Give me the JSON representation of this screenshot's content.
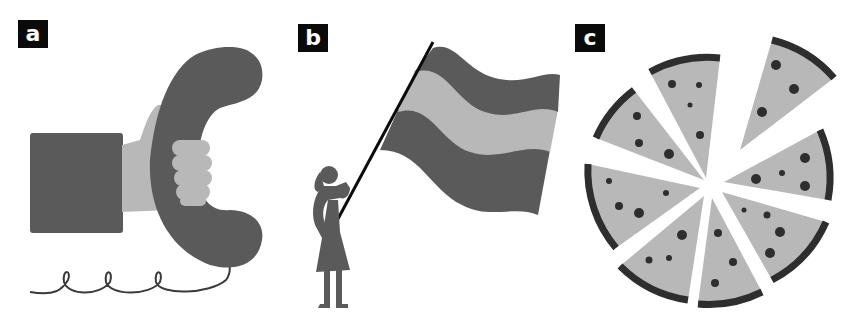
{
  "figure": {
    "panels": [
      {
        "label": "a",
        "subject": "hand-holding-telephone-handset"
      },
      {
        "label": "b",
        "subject": "woman-waving-striped-flag"
      },
      {
        "label": "c",
        "subject": "sliced-pizza"
      }
    ]
  },
  "colors": {
    "dark": "#5c5c5c",
    "light": "#b8b8b8",
    "black": "#0a0a0a",
    "crust": "#2e2e2e",
    "background": "#ffffff"
  }
}
